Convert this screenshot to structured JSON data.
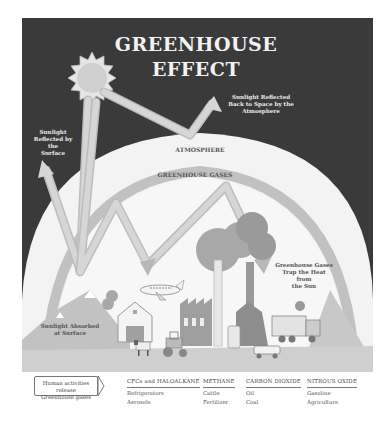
{
  "title": {
    "line1": "GREENHOUSE",
    "line2": "EFFECT"
  },
  "labels": {
    "reflected_space": [
      "Sunlight Reflected",
      "Back to Space by the",
      "Atmosphere"
    ],
    "reflected_surface": [
      "Sunlight",
      "Reflected by the",
      "Surface"
    ],
    "atmosphere": "ATMOSPHERE",
    "greenhouse_gases_band": "GREENHOUSE GASES",
    "trap_heat": [
      "Greenhouse Gases",
      "Trap the Heat from",
      "the Sun"
    ],
    "absorbed": [
      "Sunlight Absorbed",
      "at Surface"
    ]
  },
  "legend": {
    "intro": [
      "Human activities release",
      "Greenhouse gases"
    ],
    "columns": [
      {
        "header": "CFCs and HALOALKANE",
        "items": [
          "Refrigerators",
          "Aerosols"
        ]
      },
      {
        "header": "METHANE",
        "items": [
          "Cattle",
          "Fertilizer"
        ]
      },
      {
        "header": "CARBON DIOXIDE",
        "items": [
          "Oil",
          "Coal"
        ]
      },
      {
        "header": "NITROUS OXIDE",
        "items": [
          "Gasoline",
          "Agriculture"
        ]
      }
    ]
  },
  "colors": {
    "sky": "#3a3a3a",
    "dome": "#f3f3f3",
    "gas_band": "#b4b4b4",
    "ray": "#d6d6d6",
    "ray_edge": "#bdbdbd",
    "sun": "#d9d9d9",
    "ground": "#c8c8c8"
  }
}
